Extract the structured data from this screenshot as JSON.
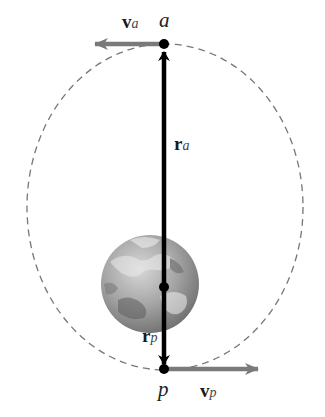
{
  "figure": {
    "type": "elliptical-orbit-diagram",
    "labels": {
      "apoapsis_point": "a",
      "periapsis_point": "p",
      "velocity_apoapsis": {
        "symbol": "v",
        "subscript": "a"
      },
      "velocity_periapsis": {
        "symbol": "v",
        "subscript": "p"
      },
      "radius_apoapsis": {
        "symbol": "r",
        "subscript": "a"
      },
      "radius_periapsis": {
        "symbol": "r",
        "subscript": "p"
      }
    },
    "elements": {
      "orbit": "dashed ellipse",
      "central_body": "Earth",
      "vectors": [
        "v_a (leftward at a)",
        "v_p (rightward at p)",
        "r_a (focus to a)",
        "r_p (focus to p)"
      ]
    },
    "colors": {
      "orbit": "#777777",
      "radius_vector": "#000000",
      "velocity_vector": "#7a7a7a",
      "earth_base": "#9a9a9a"
    }
  }
}
